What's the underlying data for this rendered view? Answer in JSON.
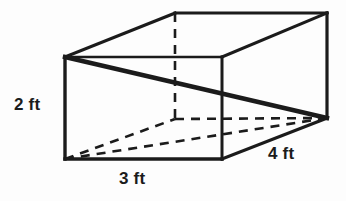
{
  "figure": {
    "name": "rectangular-prism-diagram",
    "shape": "rectangular prism",
    "unit": "ft",
    "stroke_color": "#1b1b1b",
    "background_color": "#fdfdfd",
    "labels": {
      "height": "2 ft",
      "width": "3 ft",
      "depth": "4 ft"
    },
    "dimensions": {
      "height_value": 2,
      "width_value": 3,
      "depth_value": 4
    },
    "geometry": {
      "front_top_left": [
        65,
        57
      ],
      "front_top_right": [
        222,
        57
      ],
      "front_bottom_right": [
        222,
        159
      ],
      "front_bottom_left": [
        65,
        159
      ],
      "back_top_left": [
        175,
        13
      ],
      "back_top_right": [
        327,
        13
      ],
      "back_bottom_right": [
        327,
        118
      ],
      "back_bottom_left": [
        175,
        119
      ]
    }
  }
}
